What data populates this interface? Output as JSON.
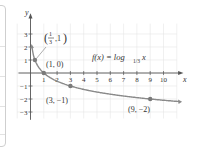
{
  "chart_data": {
    "type": "line",
    "function_label": {
      "prefix": "f(x) = log",
      "base": "1/3",
      "var": "x"
    },
    "xlabel": "x",
    "ylabel": "y",
    "xlim": [
      -0.5,
      11
    ],
    "ylim": [
      -3.5,
      3.8
    ],
    "x_ticks": [
      "1",
      "2",
      "3",
      "4",
      "5",
      "6",
      "7",
      "8",
      "9",
      "10"
    ],
    "y_ticks": [
      "3",
      "2",
      "1",
      "-1",
      "-2",
      "-3"
    ],
    "grid": true,
    "points": [
      {
        "label": "(1/3, 1)",
        "x": 0.3333,
        "y": 1
      },
      {
        "label": "(1, 0)",
        "x": 1,
        "y": 0
      },
      {
        "label": "(3, −1)",
        "x": 3,
        "y": -1
      },
      {
        "label": "(9, −2)",
        "x": 9,
        "y": -2
      }
    ],
    "series": [
      {
        "name": "f(x) = log_{1/3} x",
        "x": [
          0.15,
          0.2,
          0.3333,
          0.5,
          1,
          2,
          3,
          5,
          7,
          9,
          11
        ],
        "y": [
          1.73,
          1.46,
          1,
          0.63,
          0,
          -0.63,
          -1,
          -1.46,
          -1.77,
          -2,
          -2.18
        ]
      }
    ],
    "colors": {
      "curve": "#8a8a8a",
      "point": "#7a7a7a",
      "axis": "#555555",
      "grid": "#e6e6e6"
    }
  },
  "labels": {
    "point_a_num": "1",
    "point_a_den": "3",
    "point_a_y": ",1",
    "point_b": "(1, 0)",
    "point_c": "(3, −1)",
    "point_d": "(9, −2)",
    "axis_x": "x",
    "axis_y": "y",
    "func_prefix": "f(x) = log",
    "func_base": "1/3",
    "func_var": " x"
  }
}
